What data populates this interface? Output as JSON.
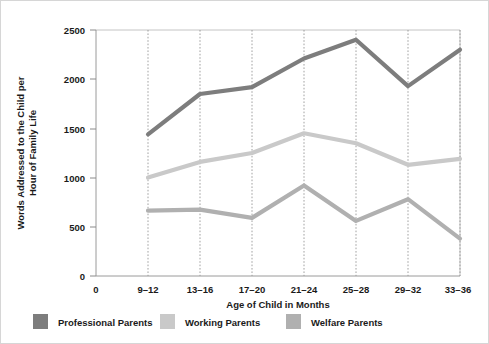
{
  "chart_data": {
    "type": "line",
    "title": "",
    "xlabel": "Age of Child in Months",
    "ylabel": "Words Addressed to the Child per Hour of Family Life",
    "categories": [
      "9–12",
      "13–16",
      "17–20",
      "21–24",
      "25–28",
      "29–32",
      "33–36"
    ],
    "x_tick_labels": [
      "0",
      "9–12",
      "13–16",
      "17–20",
      "21–24",
      "25–28",
      "29–32",
      "33–36"
    ],
    "y_tick_labels": [
      "0",
      "500",
      "1000",
      "1500",
      "2000",
      "2500"
    ],
    "y_ticks": [
      0,
      500,
      1000,
      1500,
      2000,
      2500
    ],
    "ylim": [
      0,
      2500
    ],
    "grid": "vertical-dotted",
    "legend_position": "bottom",
    "series": [
      {
        "name": "Professional Parents",
        "color": "#7d7d7d",
        "values": [
          1440,
          1850,
          1920,
          2210,
          2400,
          1930,
          2300
        ]
      },
      {
        "name": "Working Parents",
        "color": "#c9c9c9",
        "values": [
          1000,
          1160,
          1250,
          1450,
          1350,
          1130,
          1190
        ]
      },
      {
        "name": "Welfare Parents",
        "color": "#b0b0b0",
        "values": [
          665,
          675,
          590,
          920,
          560,
          780,
          380
        ]
      }
    ]
  },
  "legend": {
    "items": [
      {
        "label": "Professional Parents",
        "color": "#7d7d7d"
      },
      {
        "label": "Working Parents",
        "color": "#c9c9c9"
      },
      {
        "label": "Welfare Parents",
        "color": "#b0b0b0"
      }
    ]
  },
  "axes": {
    "y_title": "Words Addressed to the Child per Hour of Family Life",
    "y_title_line1": "Words Addressed to the Child per",
    "y_title_line2": "Hour of Family Life",
    "x_title": "Age of Child in Months"
  }
}
